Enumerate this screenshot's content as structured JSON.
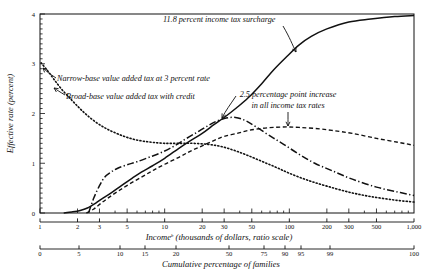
{
  "chart_data": {
    "type": "line",
    "title": "",
    "ylabel": "Effective rate (percent)",
    "xlabel": "Incomeᵇ (thousands of dollars, ratio scale)",
    "xlabel_main": "Income",
    "xlabel_sup": "b",
    "xlabel_rest": " (thousands of dollars, ratio scale)",
    "xlabel2": "Cumulative percentage of families",
    "ylim": [
      0,
      4
    ],
    "yticks": [
      0,
      1,
      2,
      3,
      4
    ],
    "yticklabels": [
      "0",
      "1",
      "2",
      "3",
      "4"
    ],
    "xscale": "log",
    "xlim": [
      1,
      1000
    ],
    "xticks": [
      1,
      2,
      3,
      5,
      10,
      20,
      30,
      50,
      100,
      200,
      300,
      500,
      1000
    ],
    "xticklabels": [
      "1",
      "2",
      "3",
      "5",
      "10",
      "20",
      "30",
      "50",
      "100",
      "200",
      "300",
      "500",
      "1,000"
    ],
    "x2ticks": [
      0,
      5,
      10,
      15,
      20,
      50,
      75,
      90,
      95,
      99,
      100
    ],
    "x2ticklabels": [
      "0",
      "5",
      "10",
      "15",
      "20",
      "50",
      "75",
      "90",
      "95",
      "99",
      "100"
    ],
    "grid": false,
    "legend_position": "inline-annotations",
    "series": [
      {
        "name": "11.8 percent income tax surcharge",
        "style": "solid",
        "x": [
          1.55,
          1.8,
          2.1,
          2.4,
          2.8,
          3.2,
          3.8,
          4.5,
          5.5,
          6.5,
          8,
          10,
          13,
          16,
          20,
          25,
          30,
          38,
          47,
          60,
          75,
          95,
          120,
          150,
          200,
          300,
          450,
          700,
          1000
        ],
        "y": [
          0.0,
          0.02,
          0.05,
          0.1,
          0.2,
          0.3,
          0.42,
          0.55,
          0.7,
          0.82,
          0.95,
          1.1,
          1.3,
          1.45,
          1.6,
          1.78,
          1.92,
          2.12,
          2.32,
          2.6,
          2.88,
          3.14,
          3.38,
          3.55,
          3.7,
          3.84,
          3.9,
          3.95,
          3.97
        ]
      },
      {
        "name": "2.5 percentage point increase in all income tax rates",
        "style": "dashed",
        "x": [
          2.35,
          2.7,
          3.1,
          3.6,
          4.3,
          5.2,
          6.5,
          8,
          10,
          13,
          16,
          20,
          25,
          30,
          38,
          47,
          60,
          75,
          95,
          120,
          160,
          220,
          320,
          500,
          750,
          1000
        ],
        "y": [
          0.0,
          0.08,
          0.2,
          0.32,
          0.45,
          0.58,
          0.72,
          0.85,
          0.98,
          1.12,
          1.24,
          1.35,
          1.46,
          1.54,
          1.6,
          1.66,
          1.7,
          1.72,
          1.73,
          1.72,
          1.7,
          1.66,
          1.6,
          1.5,
          1.42,
          1.36
        ]
      },
      {
        "name": "Broad-base value added tax with credit",
        "style": "dashdot",
        "x": [
          2.45,
          2.7,
          3.0,
          3.3,
          3.7,
          4.2,
          5.0,
          6.0,
          7.5,
          9.5,
          12,
          15,
          19,
          24,
          30,
          37,
          45,
          55,
          70,
          90,
          120,
          160,
          220,
          320,
          500,
          750,
          1000
        ],
        "y": [
          0.0,
          0.3,
          0.55,
          0.72,
          0.82,
          0.9,
          0.97,
          1.03,
          1.12,
          1.22,
          1.35,
          1.5,
          1.65,
          1.8,
          1.9,
          1.92,
          1.85,
          1.72,
          1.55,
          1.38,
          1.18,
          1.0,
          0.85,
          0.68,
          0.52,
          0.42,
          0.35
        ]
      },
      {
        "name": "Narrow-base value added tax at 3 percent rate",
        "style": "dotted",
        "x": [
          1.02,
          1.15,
          1.3,
          1.5,
          1.75,
          2.05,
          2.4,
          2.9,
          3.5,
          4.3,
          5.3,
          6.5,
          8,
          10,
          13,
          17,
          22,
          28,
          36,
          46,
          60,
          78,
          100,
          140,
          200,
          300,
          450,
          700,
          1000
        ],
        "y": [
          3.02,
          2.86,
          2.68,
          2.48,
          2.3,
          2.12,
          1.96,
          1.8,
          1.68,
          1.58,
          1.5,
          1.45,
          1.42,
          1.4,
          1.4,
          1.4,
          1.38,
          1.34,
          1.26,
          1.16,
          1.04,
          0.92,
          0.8,
          0.66,
          0.54,
          0.42,
          0.33,
          0.26,
          0.22
        ]
      }
    ],
    "annotations": [
      {
        "id": "surcharge-annotation",
        "text": "11.8 percent income tax surcharge",
        "series": "11.8 percent income tax surcharge"
      },
      {
        "id": "narrow-base-annotation",
        "text": "Narrow-base value added tax at 3 percent rate",
        "series": "Narrow-base value added tax at 3 percent rate"
      },
      {
        "id": "broad-base-annotation",
        "text": "Broad-base value added tax with credit",
        "series": "Broad-base value added tax with credit"
      },
      {
        "id": "income-tax-increase-annotation-line1",
        "text": "2.5 percentage point increase",
        "series": "2.5 percentage point increase in all income tax rates"
      },
      {
        "id": "income-tax-increase-annotation-line2",
        "text": "in all income tax rates",
        "series": "2.5 percentage point increase in all income tax rates"
      }
    ]
  }
}
